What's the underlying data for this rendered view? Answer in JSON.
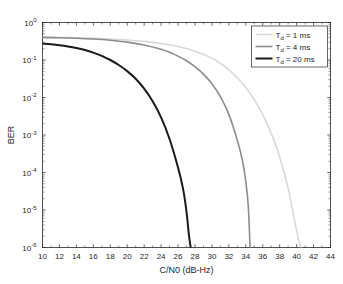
{
  "figure": {
    "background": "#ffffff",
    "axes_color": "#262626"
  },
  "chart_data": {
    "type": "line",
    "title": "",
    "subtitle": "",
    "xlabel": "C/N0 (dB-Hz)",
    "ylabel": "BER",
    "xlim": [
      10,
      44
    ],
    "ylim": [
      1e-06,
      1
    ],
    "yscale": "log",
    "xscale": "linear",
    "grid": false,
    "xticks": [
      10,
      12,
      14,
      16,
      18,
      20,
      22,
      24,
      26,
      28,
      30,
      32,
      34,
      36,
      38,
      40,
      42,
      44
    ],
    "xticklabels": [
      "10",
      "12",
      "14",
      "16",
      "18",
      "20",
      "22",
      "24",
      "26",
      "28",
      "30",
      "32",
      "34",
      "36",
      "38",
      "40",
      "42",
      "44"
    ],
    "yticks": [
      1,
      0.1,
      0.01,
      0.001,
      0.0001,
      1e-05,
      1e-06
    ],
    "yticklabels": [
      "10^0",
      "10^-1",
      "10^-2",
      "10^-3",
      "10^-4",
      "10^-5",
      "10^-6"
    ],
    "ytick_mantissa": "10",
    "ytick_exponents": [
      "0",
      "-1",
      "-2",
      "-3",
      "-4",
      "-5",
      "-6"
    ],
    "legend_position": "upper right",
    "legend_entries": [
      "T_d = 1 ms",
      "T_d = 4 ms",
      "T_d = 20 ms"
    ],
    "series": [
      {
        "name": "T_d = 1 ms",
        "label_prefix": "T",
        "label_sub": "d",
        "label_suffix": " = 1 ms",
        "color": "#d9d9d9",
        "width": 1.6,
        "x": [
          10,
          12,
          14,
          16,
          18,
          20,
          22,
          24,
          26,
          28,
          30,
          31,
          32,
          33,
          34,
          35,
          36,
          37,
          38,
          39,
          39.6,
          40.1,
          40.4,
          40.5
        ],
        "y": [
          0.4,
          0.395,
          0.388,
          0.378,
          0.363,
          0.342,
          0.313,
          0.275,
          0.228,
          0.172,
          0.112,
          0.081,
          0.0545,
          0.0335,
          0.0185,
          0.0088,
          0.0035,
          0.00112,
          0.00026,
          3.8e-05,
          8e-06,
          2.2e-06,
          1.2e-06,
          1e-06
        ]
      },
      {
        "name": "T_d = 4 ms",
        "label_prefix": "T",
        "label_sub": "d",
        "label_suffix": " = 4 ms",
        "color": "#8c8c8c",
        "width": 1.6,
        "x": [
          10,
          12,
          14,
          16,
          18,
          20,
          22,
          24,
          25,
          26,
          27,
          28,
          29,
          30,
          31,
          32,
          33,
          33.6,
          34.0,
          34.3,
          34.5
        ],
        "y": [
          0.4,
          0.392,
          0.38,
          0.362,
          0.336,
          0.3,
          0.252,
          0.193,
          0.16,
          0.127,
          0.0955,
          0.0665,
          0.042,
          0.0232,
          0.0105,
          0.00355,
          0.00072,
          0.00021,
          5.8e-05,
          1.2e-05,
          1e-06
        ]
      },
      {
        "name": "T_d = 20 ms",
        "label_prefix": "T",
        "label_sub": "d",
        "label_suffix": " = 20 ms",
        "color": "#1a1a1a",
        "width": 2.0,
        "x": [
          10,
          11,
          12,
          13,
          14,
          15,
          16,
          17,
          18,
          19,
          20,
          21,
          22,
          23,
          24,
          25,
          26,
          26.6,
          27.0,
          27.3,
          27.5
        ],
        "y": [
          0.275,
          0.262,
          0.247,
          0.229,
          0.208,
          0.184,
          0.157,
          0.129,
          0.1,
          0.0735,
          0.0505,
          0.0315,
          0.0172,
          0.008,
          0.00295,
          0.00078,
          0.000135,
          3.6e-05,
          9e-06,
          2e-06,
          1e-06
        ]
      }
    ]
  }
}
